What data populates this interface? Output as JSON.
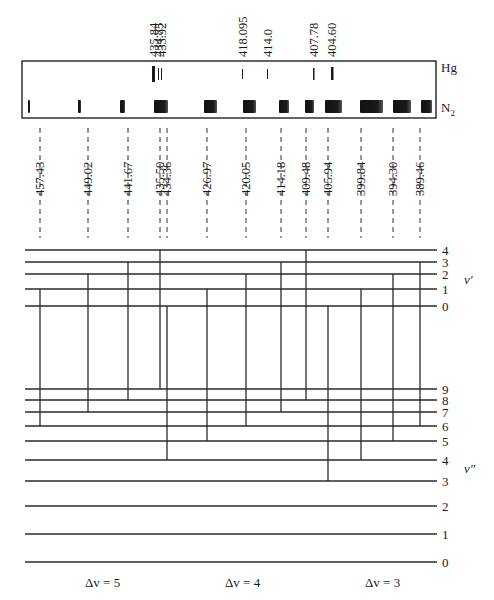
{
  "figure": {
    "title": "",
    "spectrum_box": {
      "x": 22,
      "y": 61,
      "w": 414,
      "h": 57
    },
    "spectrum_labels": {
      "hg": "Hg",
      "n2": "N",
      "n2_sub": "2"
    },
    "hg_lines": [
      {
        "label": "435.84",
        "x": 152,
        "w": 3,
        "h": 16,
        "y": 66
      },
      {
        "label": "434.75",
        "x": 158,
        "w": 1,
        "h": 12,
        "y": 68
      },
      {
        "label": "433.92",
        "x": 161,
        "w": 1,
        "h": 12,
        "y": 68
      },
      {
        "label": "418.095",
        "x": 242,
        "w": 1,
        "h": 10,
        "y": 69
      },
      {
        "label": "414.0",
        "x": 267,
        "w": 1,
        "h": 10,
        "y": 69
      },
      {
        "label": "407.78",
        "x": 313,
        "w": 1.5,
        "h": 12,
        "y": 68
      },
      {
        "label": "404.60",
        "x": 331,
        "w": 2.5,
        "h": 13,
        "y": 67
      }
    ],
    "n2_bands": [
      {
        "x": 28,
        "w": 2
      },
      {
        "x": 78,
        "w": 3
      },
      {
        "x": 120,
        "w": 5
      },
      {
        "x": 154,
        "w": 14
      },
      {
        "x": 204,
        "w": 13
      },
      {
        "x": 243,
        "w": 13
      },
      {
        "x": 279,
        "w": 10
      },
      {
        "x": 305,
        "w": 9
      },
      {
        "x": 325,
        "w": 17
      },
      {
        "x": 360,
        "w": 23
      },
      {
        "x": 393,
        "w": 18
      },
      {
        "x": 421,
        "w": 11
      }
    ],
    "transitions": [
      {
        "wavelength": "457.43",
        "x": 40,
        "v_upper": 1,
        "v_lower": 6,
        "dv": 5
      },
      {
        "wavelength": "449.02",
        "x": 88,
        "v_upper": 2,
        "v_lower": 7,
        "dv": 5
      },
      {
        "wavelength": "441.67",
        "x": 128,
        "v_upper": 3,
        "v_lower": 8,
        "dv": 5
      },
      {
        "wavelength": "435.50",
        "x": 160,
        "v_upper": 4,
        "v_lower": 9,
        "dv": 5
      },
      {
        "wavelength": "434.36",
        "x": 167,
        "v_upper": 0,
        "v_lower": 4,
        "dv": 4
      },
      {
        "wavelength": "426.97",
        "x": 207,
        "v_upper": 1,
        "v_lower": 5,
        "dv": 4
      },
      {
        "wavelength": "420.05",
        "x": 246,
        "v_upper": 2,
        "v_lower": 6,
        "dv": 4
      },
      {
        "wavelength": "414.18",
        "x": 281,
        "v_upper": 3,
        "v_lower": 7,
        "dv": 4
      },
      {
        "wavelength": "409.48",
        "x": 306,
        "v_upper": 4,
        "v_lower": 8,
        "dv": 4
      },
      {
        "wavelength": "405.94",
        "x": 328,
        "v_upper": 0,
        "v_lower": 3,
        "dv": 3
      },
      {
        "wavelength": "399.84",
        "x": 361,
        "v_upper": 1,
        "v_lower": 4,
        "dv": 3
      },
      {
        "wavelength": "394.30",
        "x": 393,
        "v_upper": 2,
        "v_lower": 5,
        "dv": 3
      },
      {
        "wavelength": "389.46",
        "x": 420,
        "v_upper": 3,
        "v_lower": 6,
        "dv": 3
      }
    ],
    "upper_levels": [
      {
        "v": "4",
        "y": 250
      },
      {
        "v": "3",
        "y": 262
      },
      {
        "v": "2",
        "y": 274
      },
      {
        "v": "1",
        "y": 289
      },
      {
        "v": "0",
        "y": 306
      }
    ],
    "lower_levels": [
      {
        "v": "9",
        "y": 389
      },
      {
        "v": "8",
        "y": 400
      },
      {
        "v": "7",
        "y": 412
      },
      {
        "v": "6",
        "y": 426
      },
      {
        "v": "5",
        "y": 441
      },
      {
        "v": "4",
        "y": 460
      },
      {
        "v": "3",
        "y": 481
      },
      {
        "v": "2",
        "y": 506
      },
      {
        "v": "1",
        "y": 534
      },
      {
        "v": "0",
        "y": 562
      }
    ],
    "level_line": {
      "x_start": 25,
      "x_end": 437
    },
    "axis_labels": {
      "upper": "v′",
      "lower": "v″"
    },
    "sequence_labels": [
      {
        "text": "Δv = 5",
        "x": 85
      },
      {
        "text": "Δv = 4",
        "x": 225
      },
      {
        "text": "Δv = 3",
        "x": 365
      }
    ]
  }
}
